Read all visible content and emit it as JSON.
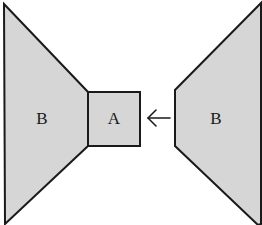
{
  "diagram": {
    "colors": {
      "fill": "#d6d6d6",
      "stroke": "#1a1a1a",
      "background": "#ffffff"
    },
    "shapes": [
      {
        "id": "left-b",
        "label": "B",
        "points": "4,4 88,92 88,146 5,224"
      },
      {
        "id": "box-a",
        "label": "A",
        "points": "88,92 140,92 140,146 88,146"
      },
      {
        "id": "right-b",
        "label": "B",
        "points": "261,3 261,224 258,225 175,146 175,90"
      }
    ],
    "labels": {
      "left_b": "B",
      "box_a": "A",
      "right_b": "B"
    },
    "arrow": {
      "direction": "left",
      "from": "right-b",
      "to": "box-a"
    }
  }
}
